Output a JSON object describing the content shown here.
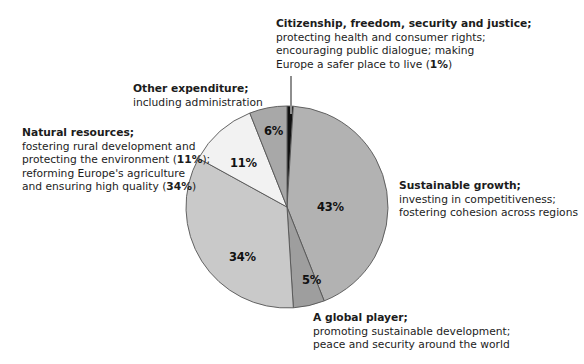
{
  "chart_data": {
    "type": "pie",
    "title": "",
    "subtitle": "",
    "xlabel": "",
    "ylabel": "",
    "legend_position": "callouts",
    "grid": false,
    "units": "%",
    "start_angle_deg": 0,
    "direction": "clockwise",
    "categories": [
      "Citizenship, freedom, security and justice",
      "Sustainable growth",
      "A global player",
      "Natural resources (agriculture)",
      "Natural resources (rural development / environment)",
      "Other expenditure"
    ],
    "values": [
      1,
      43,
      5,
      34,
      11,
      6
    ],
    "slices": [
      {
        "key": "citizenship",
        "value": 1,
        "label": "1%",
        "color": "#111111",
        "start_deg": 0,
        "end_deg": 3.6
      },
      {
        "key": "sustainable-growth",
        "value": 43,
        "label": "43%",
        "color": "#b2b2b2",
        "start_deg": 3.6,
        "end_deg": 158.4
      },
      {
        "key": "global-player",
        "value": 5,
        "label": "5%",
        "color": "#9e9e9e",
        "start_deg": 158.4,
        "end_deg": 176.4
      },
      {
        "key": "agriculture",
        "value": 34,
        "label": "34%",
        "color": "#c9c9c9",
        "start_deg": 176.4,
        "end_deg": 298.8
      },
      {
        "key": "rural-environment",
        "value": 11,
        "label": "11%",
        "color": "#f2f2f2",
        "start_deg": 298.8,
        "end_deg": 338.4
      },
      {
        "key": "other-expenditure",
        "value": 6,
        "label": "6%",
        "color": "#a8a8a8",
        "start_deg": 338.4,
        "end_deg": 360
      }
    ],
    "annotations": [
      {
        "key": "citizenship",
        "heading": "Citizenship, freedom, security and justice;",
        "lines": [
          "protecting health and consumer rights;",
          "encouraging public dialogue; making",
          "Europe a safer place to live (1%)"
        ],
        "emphasis": [
          "1%"
        ]
      },
      {
        "key": "other-expenditure",
        "heading": "Other expenditure;",
        "lines": [
          "including administration"
        ],
        "emphasis": []
      },
      {
        "key": "natural-resources",
        "heading": "Natural resources;",
        "lines": [
          "fostering rural development and",
          "protecting the environment (11%);",
          "reforming Europe's agriculture",
          "and ensuring high quality (34%)"
        ],
        "emphasis": [
          "11%",
          "34%"
        ]
      },
      {
        "key": "sustainable-growth",
        "heading": "Sustainable growth;",
        "lines": [
          "investing in competitiveness;",
          "fostering cohesion across regions"
        ],
        "emphasis": []
      },
      {
        "key": "global-player",
        "heading": "A global player;",
        "lines": [
          "promoting sustainable development;",
          "peace and security around the world"
        ],
        "emphasis": []
      }
    ]
  },
  "pie_labels": {
    "sustainable_growth": "43%",
    "global_player": "5%",
    "agriculture": "34%",
    "rural_environment": "11%",
    "other_expenditure": "6%"
  },
  "callouts": {
    "citizenship": {
      "heading": "Citizenship, freedom, security and justice;",
      "line1": "protecting health and consumer rights;",
      "line2": "encouraging public dialogue; making",
      "line3_pre": "Europe a safer place to live (",
      "line3_bold": "1%",
      "line3_post": ")"
    },
    "other_expenditure": {
      "heading": "Other expenditure;",
      "line1": "including administration"
    },
    "natural_resources": {
      "heading": "Natural resources;",
      "line1": "fostering rural development and",
      "line2_pre": "protecting the environment (",
      "line2_bold": "11%",
      "line2_post": ");",
      "line3": "reforming Europe's agriculture",
      "line4_pre": "and ensuring high quality (",
      "line4_bold": "34%",
      "line4_post": ")"
    },
    "sustainable_growth": {
      "heading": "Sustainable growth;",
      "line1": "investing in competitiveness;",
      "line2": "fostering cohesion across regions"
    },
    "global_player": {
      "heading": "A global player;",
      "line1": "promoting sustainable development;",
      "line2": "peace and security around the world"
    }
  },
  "colors": {
    "background": "#ffffff",
    "text": "#1c1c1c",
    "slice_outline": "#555555",
    "leader_line": "#8e8e8e"
  }
}
